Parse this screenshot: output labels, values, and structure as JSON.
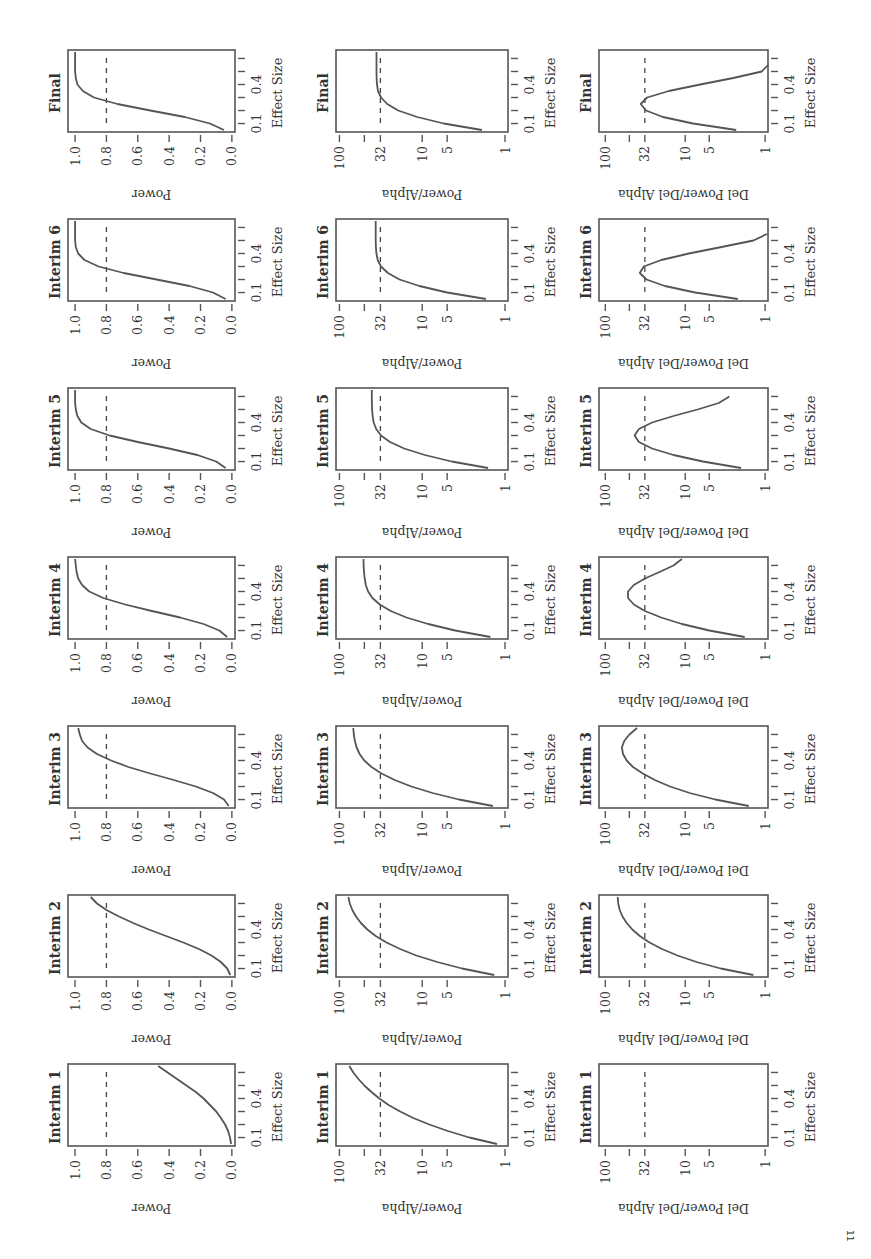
{
  "chart_data": {
    "type": "line",
    "layout": "grid of 7 rows x 3 columns, whole figure rotated 90 degrees on the page",
    "rows": [
      "Final",
      "Interim 6",
      "Interim 5",
      "Interim 4",
      "Interim 3",
      "Interim 2",
      "Interim 1"
    ],
    "columns": [
      {
        "ylabel": "Power",
        "scale": "linear",
        "yticks": [
          0.0,
          0.2,
          0.4,
          0.6,
          0.8,
          1.0
        ],
        "ytick_labels": [
          "0.0",
          "0.2",
          "0.4",
          "0.6",
          "0.8",
          "1.0"
        ],
        "ylim": [
          -0.02,
          1.045
        ],
        "reference_line": 0.8
      },
      {
        "ylabel": "Power/Alpha",
        "scale": "log",
        "yticks": [
          1,
          5,
          10,
          32,
          50,
          100
        ],
        "ytick_labels": [
          "1",
          "5",
          "10",
          "32",
          "",
          "100"
        ],
        "ylim": [
          0.92,
          110
        ],
        "reference_line": 32
      },
      {
        "ylabel": "Del Power/Del Alpha",
        "scale": "log",
        "yticks": [
          1,
          5,
          10,
          32,
          50,
          100
        ],
        "ytick_labels": [
          "1",
          "5",
          "10",
          "32",
          "",
          "100"
        ],
        "ylim": [
          0.92,
          120
        ],
        "reference_line": 32
      }
    ],
    "xlabel": "Effect Size",
    "xticks": [
      0.1,
      0.2,
      0.3,
      0.4,
      0.5,
      0.6
    ],
    "xtick_labels": [
      "0.1",
      "",
      "",
      "0.4",
      "",
      ""
    ],
    "xlim": [
      0.035,
      0.665
    ],
    "x": [
      0.05,
      0.1,
      0.15,
      0.2,
      0.25,
      0.3,
      0.35,
      0.4,
      0.45,
      0.5,
      0.55,
      0.6,
      0.65
    ],
    "panels": [
      {
        "row": "Final",
        "column": "Power",
        "values": [
          0.05,
          0.14,
          0.3,
          0.52,
          0.73,
          0.88,
          0.95,
          0.985,
          0.995,
          1.0,
          1.0,
          1.0,
          1.0
        ]
      },
      {
        "row": "Final",
        "column": "Power/Alpha",
        "values": [
          1.9,
          5.5,
          11.5,
          19.5,
          26.5,
          31.5,
          34.2,
          35.2,
          35.6,
          35.7,
          35.7,
          35.7,
          35.7
        ]
      },
      {
        "row": "Final",
        "column": "Del Power/Del Alpha",
        "values": [
          2.3,
          8.0,
          19.0,
          31.0,
          36.0,
          30.0,
          16.0,
          6.5,
          2.5,
          1.1,
          0.9,
          null,
          null
        ]
      },
      {
        "row": "Interim 6",
        "column": "Power",
        "values": [
          0.04,
          0.12,
          0.27,
          0.48,
          0.69,
          0.85,
          0.94,
          0.98,
          0.995,
          1.0,
          1.0,
          1.0,
          1.0
        ]
      },
      {
        "row": "Interim 6",
        "column": "Power/Alpha",
        "values": [
          1.7,
          5.0,
          10.8,
          18.8,
          26.0,
          31.5,
          34.5,
          35.8,
          36.3,
          36.5,
          36.5,
          36.5,
          36.5
        ]
      },
      {
        "row": "Interim 6",
        "column": "Del Power/Del Alpha",
        "values": [
          2.2,
          7.5,
          18.0,
          30.5,
          37.0,
          33.0,
          20.0,
          9.0,
          3.5,
          1.4,
          0.95,
          null,
          null
        ]
      },
      {
        "row": "Interim 5",
        "column": "Power",
        "values": [
          0.04,
          0.1,
          0.22,
          0.4,
          0.6,
          0.78,
          0.9,
          0.96,
          0.985,
          0.995,
          1.0,
          1.0,
          1.0
        ]
      },
      {
        "row": "Interim 5",
        "column": "Power/Alpha",
        "values": [
          1.6,
          4.4,
          9.3,
          16.5,
          24.5,
          31.5,
          36.0,
          38.5,
          39.8,
          40.3,
          40.5,
          40.6,
          40.6
        ]
      },
      {
        "row": "Interim 5",
        "column": "Del Power/Del Alpha",
        "values": [
          2.0,
          6.0,
          14.0,
          26.0,
          38.0,
          43.0,
          38.0,
          26.0,
          14.0,
          7.0,
          3.8,
          2.8,
          null
        ]
      },
      {
        "row": "Interim 4",
        "column": "Power",
        "values": [
          0.03,
          0.08,
          0.18,
          0.33,
          0.51,
          0.68,
          0.82,
          0.91,
          0.955,
          0.98,
          0.99,
          0.995,
          1.0
        ]
      },
      {
        "row": "Interim 4",
        "column": "Power/Alpha",
        "values": [
          1.5,
          4.0,
          8.5,
          15.5,
          24.0,
          32.5,
          40.0,
          45.0,
          48.0,
          49.5,
          50.5,
          51.0,
          51.2
        ]
      },
      {
        "row": "Interim 4",
        "column": "Del Power/Del Alpha",
        "values": [
          1.8,
          5.0,
          11.0,
          20.0,
          32.0,
          44.0,
          52.0,
          52.0,
          44.0,
          32.0,
          21.0,
          14.0,
          11.0
        ]
      },
      {
        "row": "Interim 3",
        "column": "Power",
        "values": [
          0.02,
          0.05,
          0.12,
          0.23,
          0.37,
          0.52,
          0.66,
          0.77,
          0.86,
          0.92,
          0.955,
          0.97,
          0.98
        ]
      },
      {
        "row": "Interim 3",
        "column": "Power/Alpha",
        "values": [
          1.4,
          3.6,
          7.5,
          13.5,
          21.5,
          31.0,
          41.0,
          50.0,
          57.0,
          62.0,
          65.0,
          67.0,
          68.0
        ]
      },
      {
        "row": "Interim 3",
        "column": "Del Power/Del Alpha",
        "values": [
          1.6,
          4.2,
          8.8,
          15.5,
          24.0,
          34.0,
          45.0,
          54.0,
          60.0,
          62.0,
          58.0,
          50.0,
          40.0
        ]
      },
      {
        "row": "Interim 2",
        "column": "Power",
        "values": [
          0.01,
          0.03,
          0.07,
          0.13,
          0.21,
          0.31,
          0.42,
          0.53,
          0.63,
          0.72,
          0.8,
          0.86,
          0.9
        ]
      },
      {
        "row": "Interim 2",
        "column": "Power/Alpha",
        "values": [
          1.35,
          3.3,
          6.6,
          11.8,
          18.5,
          27.0,
          36.5,
          46.0,
          55.0,
          63.0,
          70.0,
          75.0,
          78.0
        ]
      },
      {
        "row": "Interim 2",
        "column": "Del Power/Del Alpha",
        "values": [
          1.4,
          3.6,
          7.2,
          12.5,
          19.5,
          28.0,
          37.0,
          46.0,
          54.0,
          61.0,
          66.0,
          69.0,
          70.0
        ]
      },
      {
        "row": "Interim 1",
        "column": "Power",
        "values": [
          0.005,
          0.012,
          0.024,
          0.043,
          0.07,
          0.1,
          0.14,
          0.18,
          0.23,
          0.29,
          0.35,
          0.41,
          0.47
        ]
      },
      {
        "row": "Interim 1",
        "column": "Power/Alpha",
        "values": [
          1.25,
          2.7,
          4.9,
          8.2,
          12.8,
          18.5,
          25.5,
          33.0,
          41.0,
          50.0,
          59.0,
          68.0,
          76.0
        ]
      },
      {
        "row": "Interim 1",
        "column": "Del Power/Del Alpha",
        "values": []
      }
    ]
  },
  "page": {
    "footer_mark": "11"
  }
}
